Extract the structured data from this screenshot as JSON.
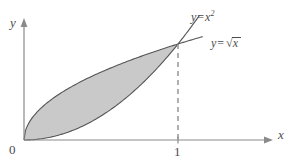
{
  "figure": {
    "title_visible": false,
    "background_color": "#ffffff",
    "axis_color": "#8a8a8a",
    "curve_color": "#555555",
    "shade_color": "#c9c9c9",
    "dash_color": "#8f8f8f",
    "text_color": "#4b4b4b",
    "axes": {
      "x_label": "x",
      "y_label": "y",
      "origin_label": "0",
      "x_ticks": [
        {
          "label": "1",
          "value": 1
        }
      ],
      "y_ticks": []
    },
    "annotations": [
      {
        "name": "curve-label-parabola",
        "lhs": "y",
        "eq": "=",
        "base": "x",
        "exponent": "2",
        "plain": "y = x²"
      },
      {
        "name": "curve-label-sqrt",
        "lhs": "y",
        "eq": "=",
        "radicand": "x",
        "radical_glyph": "√",
        "plain": "y = √x"
      }
    ],
    "dashed_guide": {
      "from_x": 1,
      "from_y": 1,
      "to_y": 0,
      "style": "dashed"
    }
  },
  "chart_data": {
    "type": "line",
    "title": "",
    "xlabel": "x",
    "ylabel": "y",
    "xlim": [
      0,
      1.16
    ],
    "ylim": [
      0,
      1.3
    ],
    "grid": false,
    "legend": "inline-curve-labels",
    "shaded_region": {
      "label": "region between y = x² and y = √x",
      "upper_curve": "y = √x",
      "lower_curve": "y = x²",
      "x_from": 0,
      "x_to": 1,
      "fill": "#c9c9c9",
      "area": 0.3333
    },
    "intersections": [
      {
        "x": 0,
        "y": 0
      },
      {
        "x": 1,
        "y": 1
      }
    ],
    "series": [
      {
        "name": "y = x²",
        "expression": "x^2",
        "x": [
          0,
          0.1,
          0.2,
          0.3,
          0.4,
          0.5,
          0.6,
          0.7,
          0.8,
          0.9,
          1.0,
          1.05,
          1.1,
          1.14
        ],
        "values": [
          0,
          0.01,
          0.04,
          0.09,
          0.16,
          0.25,
          0.36,
          0.49,
          0.64,
          0.81,
          1.0,
          1.1025,
          1.21,
          1.2996
        ]
      },
      {
        "name": "y = √x",
        "expression": "sqrt(x)",
        "x": [
          0,
          0.05,
          0.1,
          0.2,
          0.3,
          0.4,
          0.5,
          0.6,
          0.7,
          0.8,
          0.9,
          1.0,
          1.1,
          1.16
        ],
        "values": [
          0,
          0.2236,
          0.3162,
          0.4472,
          0.5477,
          0.6325,
          0.7071,
          0.7746,
          0.8367,
          0.8944,
          0.9487,
          1.0,
          1.0488,
          1.077
        ]
      }
    ]
  }
}
